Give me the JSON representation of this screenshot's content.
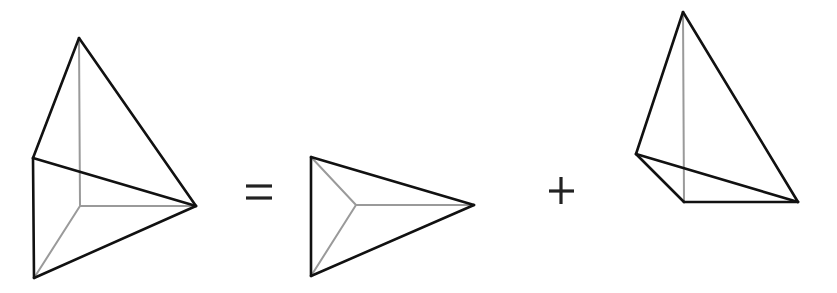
{
  "diagram": {
    "colors": {
      "visible_edge": "#111111",
      "hidden_edge": "#9a9a9a",
      "operator": "#222222",
      "background": "#ffffff"
    },
    "operators": [
      {
        "symbol": "=",
        "name": "equals"
      },
      {
        "symbol": "+",
        "name": "plus"
      }
    ],
    "figures": [
      {
        "name": "composite-solid",
        "vertices": {
          "top": [
            79,
            38
          ],
          "left": [
            33,
            158
          ],
          "right": [
            196,
            206
          ],
          "bottom": [
            34,
            278
          ],
          "inner": [
            80,
            206
          ]
        },
        "visible_edges": [
          [
            "top",
            "left"
          ],
          [
            "top",
            "right"
          ],
          [
            "left",
            "right"
          ],
          [
            "left",
            "bottom"
          ],
          [
            "bottom",
            "right"
          ]
        ],
        "hidden_edges": [
          [
            "top",
            "inner"
          ],
          [
            "inner",
            "right"
          ],
          [
            "inner",
            "bottom"
          ]
        ]
      },
      {
        "name": "tetrahedron-a",
        "vertices": {
          "top_left": [
            311,
            157
          ],
          "bottom_left": [
            311,
            276
          ],
          "right": [
            474,
            205
          ],
          "inner": [
            356,
            205
          ]
        },
        "visible_edges": [
          [
            "top_left",
            "bottom_left"
          ],
          [
            "top_left",
            "right"
          ],
          [
            "bottom_left",
            "right"
          ]
        ],
        "hidden_edges": [
          [
            "top_left",
            "inner"
          ],
          [
            "bottom_left",
            "inner"
          ],
          [
            "inner",
            "right"
          ]
        ]
      },
      {
        "name": "tetrahedron-b",
        "vertices": {
          "top": [
            683,
            12
          ],
          "left": [
            636,
            154
          ],
          "inner": [
            684,
            202
          ],
          "right": [
            798,
            202
          ]
        },
        "visible_edges": [
          [
            "top",
            "left"
          ],
          [
            "top",
            "right"
          ],
          [
            "left",
            "right"
          ],
          [
            "left",
            "inner"
          ],
          [
            "inner",
            "right"
          ]
        ],
        "hidden_edges": [
          [
            "top",
            "inner"
          ]
        ]
      }
    ]
  }
}
